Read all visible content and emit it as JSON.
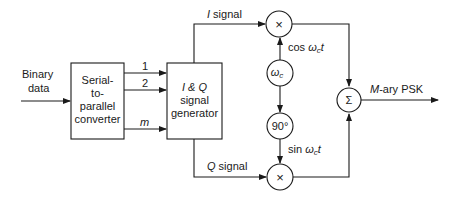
{
  "diagram": {
    "input": {
      "line1": "Binary",
      "line2": "data"
    },
    "serial_to_parallel": {
      "line1": "Serial-",
      "line2": "to-",
      "line3": "parallel",
      "line4": "converter"
    },
    "parallel_lines": [
      "1",
      "2",
      "m"
    ],
    "iq_generator": {
      "line1": "I & Q",
      "line2": "signal",
      "line3": "generator"
    },
    "i_signal": {
      "var": "I",
      "text": " signal"
    },
    "q_signal": {
      "var": "Q",
      "text": " signal"
    },
    "multiplier_symbol": "×",
    "oscillator": {
      "symbol": "ω",
      "sub": "c"
    },
    "phase_shift": "90°",
    "cos_label": {
      "fn": "cos ",
      "w": "ω",
      "sub": "c",
      "t": "t"
    },
    "sin_label": {
      "fn": "sin ",
      "w": "ω",
      "sub": "c",
      "t": "t"
    },
    "summer_symbol": "Σ",
    "output": {
      "var": "M",
      "text": "-ary PSK"
    }
  }
}
